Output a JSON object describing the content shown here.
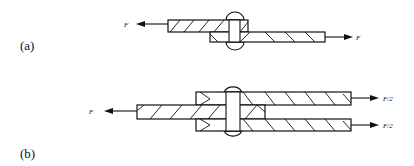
{
  "figure": {
    "panels": [
      {
        "id": "a",
        "label": "(a)",
        "joint_type": "single shear lap joint",
        "forces": [
          {
            "label": "F",
            "direction": "left",
            "applied_to": "upper plate"
          },
          {
            "label": "F",
            "direction": "right",
            "applied_to": "lower plate"
          }
        ]
      },
      {
        "id": "b",
        "label": "(b)",
        "joint_type": "double shear joint",
        "forces": [
          {
            "label": "F",
            "direction": "left",
            "applied_to": "middle plate"
          },
          {
            "label": "F/2",
            "direction": "right",
            "applied_to": "top plate"
          },
          {
            "label": "F/2",
            "direction": "right",
            "applied_to": "bottom plate"
          }
        ]
      }
    ]
  },
  "colors": {
    "line": "#111111",
    "background": "#ffffff"
  }
}
